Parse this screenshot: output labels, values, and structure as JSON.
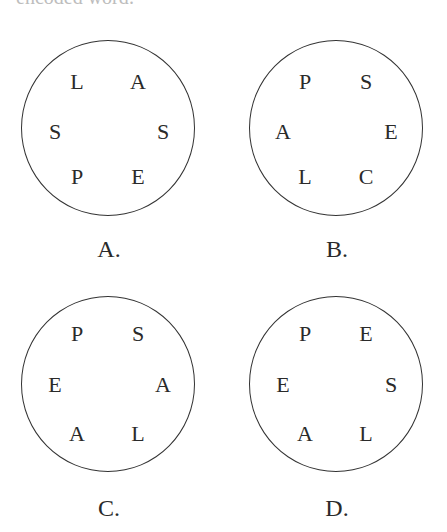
{
  "header": {
    "cut_text": "encoded word:"
  },
  "options": [
    {
      "label": "A.",
      "letters": [
        "L",
        "A",
        "S",
        "S",
        "P",
        "E"
      ]
    },
    {
      "label": "B.",
      "letters": [
        "P",
        "S",
        "A",
        "E",
        "L",
        "C"
      ]
    },
    {
      "label": "C.",
      "letters": [
        "P",
        "S",
        "E",
        "A",
        "A",
        "L"
      ]
    },
    {
      "label": "D.",
      "letters": [
        "P",
        "E",
        "E",
        "S",
        "A",
        "L"
      ]
    }
  ],
  "colors": {
    "stroke": "#333333",
    "text": "#2a2a2a",
    "background": "#ffffff"
  }
}
